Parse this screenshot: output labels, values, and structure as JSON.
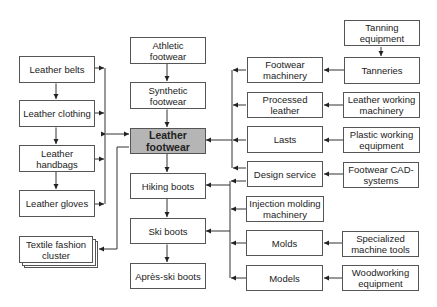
{
  "diagram": {
    "center": {
      "label": "Leather footwear",
      "fill": "#b5b5b5"
    },
    "left_column": [
      {
        "id": "leather-belts",
        "label": "Leather belts"
      },
      {
        "id": "leather-clothing",
        "label": "Leather clothing"
      },
      {
        "id": "leather-handbags",
        "label": "Leather handbags"
      },
      {
        "id": "leather-gloves",
        "label": "Leather gloves"
      },
      {
        "id": "textile-fashion-cluster",
        "label": "Textile fashion cluster"
      }
    ],
    "center_column": [
      {
        "id": "athletic-footwear",
        "label": "Athletic footwear"
      },
      {
        "id": "synthetic-footwear",
        "label": "Synthetic footwear"
      },
      {
        "id": "leather-footwear",
        "label": "Leather footwear"
      },
      {
        "id": "hiking-boots",
        "label": "Hiking boots"
      },
      {
        "id": "ski-boots",
        "label": "Ski boots"
      },
      {
        "id": "apres-ski-boots",
        "label": "Après-ski boots"
      }
    ],
    "supplier_column": [
      {
        "id": "footwear-machinery",
        "label": "Footwear machinery"
      },
      {
        "id": "processed-leather",
        "label": "Processed leather"
      },
      {
        "id": "lasts",
        "label": "Lasts"
      },
      {
        "id": "design-service",
        "label": "Design service"
      },
      {
        "id": "injection-molding-machinery",
        "label": "Injection molding machinery"
      },
      {
        "id": "molds",
        "label": "Molds"
      },
      {
        "id": "models",
        "label": "Models"
      }
    ],
    "upstream_column": [
      {
        "id": "tanning-equipment",
        "label": "Tanning equipment"
      },
      {
        "id": "tanneries",
        "label": "Tanneries"
      },
      {
        "id": "leather-working-machinery",
        "label": "Leather working machinery"
      },
      {
        "id": "plastic-working-equipment",
        "label": "Plastic working equipment"
      },
      {
        "id": "footwear-cad-systems",
        "label": "Footwear CAD-systems"
      },
      {
        "id": "specialized-machine-tools",
        "label": "Specialized machine tools"
      },
      {
        "id": "woodworking-equipment",
        "label": "Woodworking equipment"
      }
    ],
    "edges": [
      {
        "from": "Tanning equipment",
        "to": "Tanneries"
      },
      {
        "from": "Tanneries",
        "to": "Footwear machinery"
      },
      {
        "from": "Leather working machinery",
        "to": "Processed leather"
      },
      {
        "from": "Plastic working equipment",
        "to": "Lasts"
      },
      {
        "from": "Footwear CAD-systems",
        "to": "Design service"
      },
      {
        "from": "Specialized machine tools",
        "to": "Molds"
      },
      {
        "from": "Woodworking equipment",
        "to": "Models"
      },
      {
        "from": "Athletic footwear",
        "to": "Synthetic footwear",
        "bidirectional": true
      },
      {
        "from": "Synthetic footwear",
        "to": "Leather footwear",
        "bidirectional": true
      },
      {
        "from": "Leather footwear",
        "to": "Hiking boots",
        "bidirectional": true
      },
      {
        "from": "Hiking boots",
        "to": "Ski boots",
        "bidirectional": true
      },
      {
        "from": "Ski boots",
        "to": "Après-ski boots",
        "bidirectional": true
      },
      {
        "from": "Leather belts",
        "to": "Leather clothing",
        "bidirectional": true
      },
      {
        "from": "Leather clothing",
        "to": "Leather handbags",
        "bidirectional": true
      },
      {
        "from": "Leather handbags",
        "to": "Leather gloves",
        "bidirectional": true
      },
      {
        "from": "Leather goods bus",
        "to": "Leather footwear",
        "bidirectional": true
      },
      {
        "from": "Leather footwear",
        "to": "Textile fashion cluster"
      },
      {
        "from": "Upper supplier bus",
        "to": "Leather footwear"
      },
      {
        "from": "Lower supplier bus",
        "to": "Hiking boots"
      },
      {
        "from": "Lower supplier bus",
        "to": "Ski boots"
      }
    ]
  }
}
